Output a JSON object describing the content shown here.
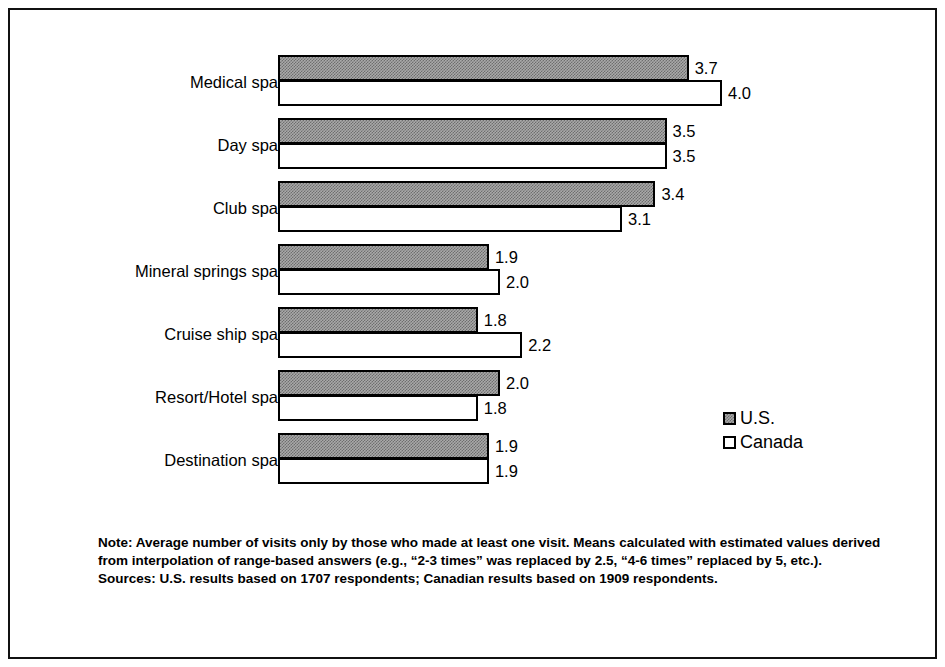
{
  "chart_data": {
    "type": "bar",
    "orientation": "horizontal",
    "title": "",
    "xlabel": "",
    "ylabel": "",
    "xlim": [
      0,
      4.2
    ],
    "grid": false,
    "legend_position": "right",
    "categories": [
      "Medical spa",
      "Day spa",
      "Club spa",
      "Mineral springs spa",
      "Cruise ship spa",
      "Resort/Hotel spa",
      "Destination spa"
    ],
    "series": [
      {
        "name": "U.S.",
        "color": "#999999",
        "values": [
          3.7,
          3.5,
          3.4,
          1.9,
          1.8,
          2.0,
          1.9
        ],
        "labels": [
          "3.7",
          "3.5",
          "3.4",
          "1.9",
          "1.8",
          "2.0",
          "1.9"
        ]
      },
      {
        "name": "Canada",
        "color": "#ffffff",
        "values": [
          4.0,
          3.5,
          3.1,
          2.0,
          2.2,
          1.8,
          1.9
        ],
        "labels": [
          "4.0",
          "3.5",
          "3.1",
          "2.0",
          "2.2",
          "1.8",
          "1.9"
        ]
      }
    ]
  },
  "legend": {
    "items": [
      {
        "label": "U.S."
      },
      {
        "label": "Canada"
      }
    ]
  },
  "footnotes": {
    "note": "Note: Average number of visits only by those who made at least one visit.  Means calculated with estimated values derived from interpolation of range-based answers (e.g., “2-3 times” was replaced by 2.5, “4-6 times” replaced by 5, etc.).",
    "sources": "Sources: U.S. results based on 1707 respondents; Canadian results based on 1909 respondents."
  }
}
